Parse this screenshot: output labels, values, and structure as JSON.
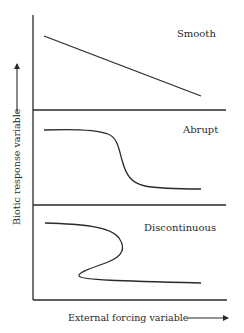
{
  "diagram": {
    "y_axis_label": "Biotic response variable",
    "x_axis_label": "External forcing variable",
    "panels": [
      {
        "label": "Smooth",
        "shape": "linear decline"
      },
      {
        "label": "Abrupt",
        "shape": "sigmoidal threshold drop"
      },
      {
        "label": "Discontinuous",
        "shape": "folded S-curve with hysteresis"
      }
    ],
    "colors": {
      "ink": "#2a2a2a",
      "background": "#ffffff"
    }
  }
}
